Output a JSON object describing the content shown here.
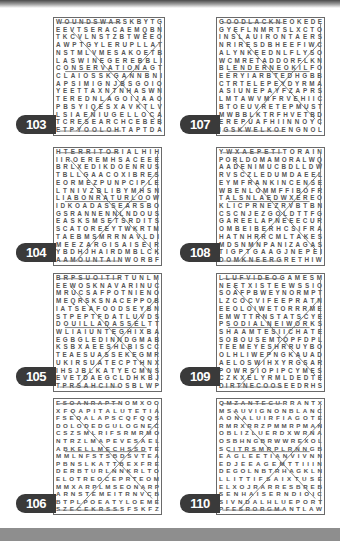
{
  "page": {
    "colors": {
      "label_bg": "#3a3a3a",
      "label_text": "#ffffff",
      "grid_border": "#6a6a6a",
      "letters": "#555555",
      "bottom_bar": "#8e8e8e"
    }
  },
  "puzzles": [
    {
      "number": "103",
      "rows": [
        "WOUNDSWARSKBYTG",
        "EEVTSERACAEMQBN",
        "TKCVLNSTZBTWEEO",
        "AWPTGYLERUPLLAT",
        "NSTMLVMESAKOETB",
        "LASWINEGEREBBLI",
        "CONSERVATIONAGT",
        "CLAIOSSKGANNBNI",
        "APSIMIGNJBSGOIO",
        "YEETTAXNTNHASWN",
        "TEREDNLAGOIJAAO",
        "PBSYIQESXAVKTLV",
        "LSIAENIUGELLOCA",
        "TCRESEARCHCEBEB",
        "ETPYOOLOHTAPTDA"
      ]
    },
    {
      "number": "107",
      "rows": [
        "GOODLACKNEOKEDE",
        "GYEFLNMRTSLXCTO",
        "INSLAUIRONTAERS",
        "NRIRESDBHEEFIWC",
        "ALYNKEEDNLFLYSO",
        "WCMRETADDORFLKN",
        "BLENDERNEOKILFO",
        "EERYIARBTEDHGBB",
        "CTRTELEPEYDYRMA",
        "ASIUNEPAYFZAPRS",
        "LMTAWVMFRVEHIIC",
        "BTOEUVRETEPMUST",
        "MWBBLKTRFHVETBD",
        "EREPUAFHIINNOYC",
        "IGSKWELKOENGNOL"
      ]
    },
    {
      "number": "104",
      "rows": [
        "HTERRITORIALHIH",
        "IIROEREMHSACEEE",
        "BRLXEDIKDOENRUS",
        "TBLLGAACOXIBRES",
        "EORMEZPUNPCIPLE",
        "LTNIVZBLIBYMHSN",
        "LIABONRATURLOOW",
        "IDKOADASSEARSBO",
        "GSRANNENNLNDOUS",
        "EASKSMSETSRDITS",
        "SCATOREEYTWKRTM",
        "TAEBMSMRRNAVLDI",
        "MEEZARGISAISEIR",
        "YBDHJHAIRDMBLCK",
        "AAMOUNTAINWORBF"
      ]
    },
    {
      "number": "108",
      "rows": [
        "YWXAEPETITORAIN",
        "PORLDOMAMORALWQ",
        "AADENIMUCBDLLDW",
        "RVSCZLEDUMDAEEL",
        "EYMFRANKINCENSE",
        "WBENLOMMFFIBOFR",
        "TALSNLAEDWXEREO",
        "KLICPRNEZRVBTBN",
        "CSCNJEZGOLDTTFG",
        "GAREELAPNEEECUR",
        "OMBEIBERHCSIFRA",
        "HATNHRRCMLTAKES",
        "MDSNMNPANIZAGAS",
        "TIGPTGAAGJNEPEI",
        "DOMKNEERGRETHIW"
      ]
    },
    {
      "number": "105",
      "rows": [
        "BRPSUOITIRTUNLM",
        "EEWOSKNAVARINUC",
        "MRUCSAFPOTNIENO",
        "MEQRSKSNACEPPOB",
        "IATSEAFOODSEYBN",
        "STPEPTFDATLUVDS",
        "DOUILLADASSELTT",
        "WLIAIUNTEGHIXBA",
        "EGBGLEDINNDGMAB",
        "KSBXAEESHLBISCC",
        "TEAESUASSEKEGMR",
        "UKIRSUATECPTHNX",
        "IHSJBLKATYECMNS",
        "EVETDAEGCLDHKBJ",
        "TPRSAHCINOSBLWP"
      ]
    },
    {
      "number": "109",
      "rows": [
        "LLUFVIDEOGAMESM",
        "NEETXISTEEWSSIO",
        "SOAFPBWEYNORMPT",
        "LZCOCVIFEEPRATN",
        "EEOLOIWETORRRME",
        "EMWTTRNSTATSCYE",
        "PSODIALNEIWORKS",
        "SHAAMTESIICHATE",
        "SOBOUSEMTOPFDPL",
        "TEEMEYESHRRUYBO",
        "OLHLIWEPNGKAUAD",
        "AELOSWIHXYRGSAR",
        "POWRSIOPIPCYMES",
        "CZKXELYRMLDEDTE",
        "DIRTNECOOSEEDRHS"
      ]
    },
    {
      "number": "106",
      "rows": [
        "ESOANRAPTNOMXOO",
        "XFOAPITALUTETIA",
        "FSEOALAPSCQFQQS",
        "DOLODEDGULOGNEC",
        "CSZSMLRIFSRMRMO",
        "NTRZLMAPEVESAEL",
        "ABKELLMECHSSDTE",
        "MMLNFSTSBDSVTEA",
        "PBNSLKATTBEXFRE",
        "DERBTURLNNKRLTO",
        "ELOTREOCEPRTEOM",
        "MMXARPLMSEONARP",
        "ARNSTEMEITRNVCB",
        "BTPLPOEATYLOEME",
        "SZECEKRSSSFSKFZ"
      ]
    },
    {
      "number": "110",
      "rows": [
        "QMZANTECURRANTX",
        "MSAUVIGNONBLANC",
        "AONALUIRFIAGOTE",
        "RMRXRRZPMMRPMAN",
        "OBLIZLUERDXWRNA",
        "OSBHNGBRWWREXOL",
        "SCITRSMRPLRNNGB",
        "EAGLEETIANVIVNN",
        "EDJEEAGEMTTIIIN",
        "DEGOLNBTRHAGKLN",
        "LLITTIFSAIXTUSE",
        "ELXOJRARRESBREB",
        "SENHAISERNDIOIC",
        "SIVNDALHLUEPORT",
        "PFESRORGMANTLAW"
      ]
    }
  ]
}
